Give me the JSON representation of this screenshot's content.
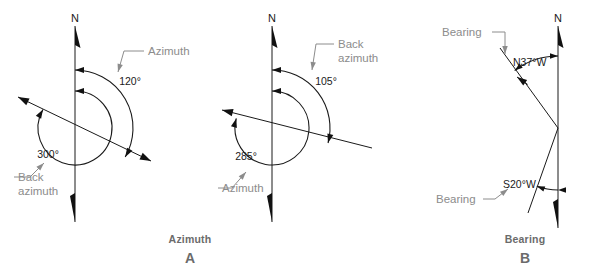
{
  "figure": {
    "width": 595,
    "height": 275,
    "background": "#ffffff",
    "ink_color": "#1a1a1a",
    "callout_color": "#8c8c8c",
    "caption_color": "#6b6b6b",
    "title_semantic": "azimuth-and-bearing-survey-diagram"
  },
  "panels": [
    {
      "id": "A",
      "caption": "Azimuth",
      "caption_letter": "A",
      "caption_x": 190,
      "caption_y": 243,
      "letter_y": 263,
      "north_label": "N",
      "north_label_x": 75,
      "north_label_y": 22,
      "north_line": {
        "x": 75,
        "y_top": 26,
        "y_bottom": 222
      },
      "origin": {
        "x": 75,
        "y": 128
      },
      "survey_line": {
        "x1": 18,
        "y1": 97,
        "x2": 151,
        "y2": 161,
        "arrow_start": true,
        "arrow_end": true
      },
      "angles": [
        {
          "name": "azimuth",
          "value_label": "120°",
          "label_x": 130,
          "label_y": 85,
          "radius": 58,
          "start_deg": 0,
          "end_deg": 120,
          "direction": "clockwise"
        },
        {
          "name": "back-azimuth",
          "value_label": "300°",
          "label_x": 48,
          "label_y": 158,
          "radius": 37,
          "start_deg": 0,
          "end_deg": 300,
          "direction": "clockwise"
        }
      ],
      "callouts": [
        {
          "name": "azimuth-callout",
          "lines": [
            "Azimuth"
          ],
          "x": 148,
          "y": 55,
          "anchor": "start",
          "leader": {
            "x1": 144,
            "y1": 51,
            "x2": 124,
            "y2": 51,
            "x3": 118,
            "y3": 72
          }
        },
        {
          "name": "back-azimuth-callout",
          "lines": [
            "Back",
            "azimuth"
          ],
          "x": 18,
          "y": 181,
          "anchor": "start",
          "leader": {
            "x1": 14,
            "y1": 177,
            "x2": 30,
            "y2": 177,
            "x3": 44,
            "y3": 163
          }
        }
      ]
    },
    {
      "id": "A2",
      "caption": "",
      "caption_letter": "",
      "north_label": "N",
      "north_label_x": 272,
      "north_label_y": 22,
      "north_line": {
        "x": 272,
        "y_top": 26,
        "y_bottom": 222
      },
      "origin": {
        "x": 272,
        "y": 128
      },
      "survey_line": {
        "x1": 222,
        "y1": 110,
        "x2": 372,
        "y2": 148,
        "arrow_start": true,
        "arrow_end": false
      },
      "angles": [
        {
          "name": "back-azimuth",
          "value_label": "105°",
          "label_x": 326,
          "label_y": 85,
          "radius": 58,
          "start_deg": 0,
          "end_deg": 105,
          "direction": "clockwise"
        },
        {
          "name": "azimuth",
          "value_label": "285°",
          "label_x": 246,
          "label_y": 160,
          "radius": 37,
          "start_deg": 0,
          "end_deg": 285,
          "direction": "clockwise"
        }
      ],
      "callouts": [
        {
          "name": "back-azimuth-callout",
          "lines": [
            "Back",
            "azimuth"
          ],
          "x": 338,
          "y": 48,
          "anchor": "start",
          "leader": {
            "x1": 334,
            "y1": 44,
            "x2": 316,
            "y2": 44,
            "x3": 312,
            "y3": 70
          }
        },
        {
          "name": "azimuth-callout",
          "lines": [
            "Azimuth"
          ],
          "x": 222,
          "y": 192,
          "anchor": "start",
          "leader": {
            "x1": 218,
            "y1": 188,
            "x2": 232,
            "y2": 188,
            "x3": 246,
            "y3": 172
          }
        }
      ]
    },
    {
      "id": "B",
      "caption": "Bearing",
      "caption_letter": "B",
      "caption_x": 525,
      "caption_y": 243,
      "letter_y": 263,
      "north_label": "N",
      "north_label_x": 558,
      "north_label_y": 22,
      "north_line": {
        "x": 558,
        "y_top": 26,
        "y_bottom": 228
      },
      "origin": {
        "x": 558,
        "y": 128
      },
      "bearing_lines": [
        {
          "name": "bearing-line-n37w",
          "label": "N37°W",
          "label_x": 513,
          "label_y": 66,
          "x1": 558,
          "y1": 128,
          "x2": 500,
          "y2": 48,
          "tick_arrow": {
            "x": 517,
            "y": 77,
            "angle_deg": 305
          },
          "angle_arc": {
            "radius": 72,
            "start_deg": 0,
            "end_deg": -37
          },
          "callout": {
            "lines": [
              "Bearing"
            ],
            "x": 442,
            "y": 36,
            "anchor": "start",
            "leader": {
              "x1": 492,
              "y1": 32,
              "x2": 505,
              "y2": 32,
              "x3": 505,
              "y3": 54
            }
          }
        },
        {
          "name": "bearing-line-s20w",
          "label": "S20°W",
          "label_x": 503,
          "label_y": 188,
          "x1": 558,
          "y1": 128,
          "x2": 528,
          "y2": 213,
          "angle_arc": {
            "radius": 62,
            "start_deg": 180,
            "end_deg": 200
          },
          "callout": {
            "lines": [
              "Bearing"
            ],
            "x": 436,
            "y": 203,
            "anchor": "start",
            "leader": {
              "x1": 483,
              "y1": 199,
              "x2": 495,
              "y2": 199,
              "x3": 508,
              "y3": 189
            }
          }
        }
      ]
    }
  ]
}
